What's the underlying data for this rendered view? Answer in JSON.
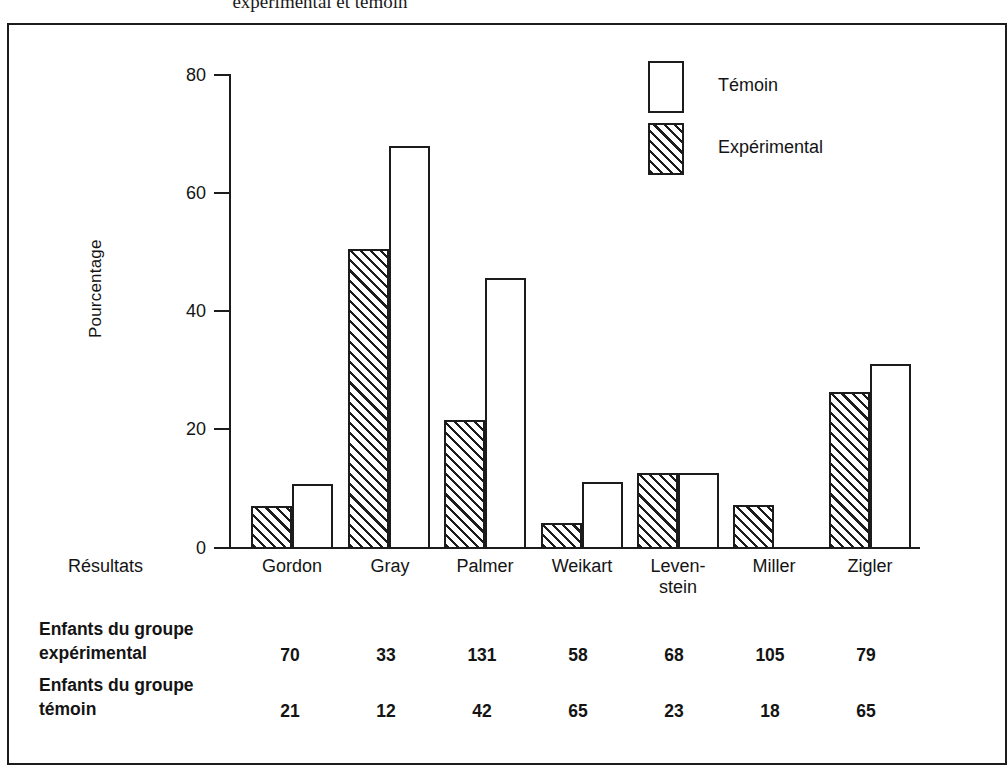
{
  "figure": {
    "title": "expérimental et témoin"
  },
  "chart_data": {
    "type": "bar",
    "title": "expérimental et témoin",
    "xlabel": "Résultats",
    "ylabel": "Pourcentage",
    "ylim": [
      0,
      80
    ],
    "yticks": [
      0,
      20,
      40,
      60,
      80
    ],
    "grid": false,
    "legend_position": "top-right",
    "categories": [
      "Gordon",
      "Gray",
      "Palmer",
      "Weikart",
      "Leven-\nstein",
      "Miller",
      "Zigler"
    ],
    "category_labels": [
      {
        "line1": "Gordon",
        "line2": ""
      },
      {
        "line1": "Gray",
        "line2": ""
      },
      {
        "line1": "Palmer",
        "line2": ""
      },
      {
        "line1": "Weikart",
        "line2": ""
      },
      {
        "line1": "Leven-",
        "line2": "stein"
      },
      {
        "line1": "Miller",
        "line2": ""
      },
      {
        "line1": "Zigler",
        "line2": ""
      }
    ],
    "series": [
      {
        "name": "Expérimental",
        "fill": "hatched",
        "values": [
          7.3,
          50.8,
          21.8,
          4.4,
          12.9,
          7.4,
          26.5
        ]
      },
      {
        "name": "Témoin",
        "fill": "white",
        "values": [
          11.0,
          68.2,
          45.8,
          11.3,
          12.9,
          null,
          31.3
        ]
      }
    ]
  },
  "axis": {
    "y_title": "Pourcentage",
    "y_ticks": [
      "80",
      "60",
      "40",
      "20",
      "0"
    ],
    "x_title": "Résultats"
  },
  "legend": {
    "items": [
      {
        "label": "Témoin",
        "fill": "white"
      },
      {
        "label": "Expérimental",
        "fill": "hatched"
      }
    ]
  },
  "table": {
    "rows": [
      {
        "header_line1": "Enfants du groupe",
        "header_line2": "expérimental",
        "values": [
          "70",
          "33",
          "131",
          "58",
          "68",
          "105",
          "79"
        ]
      },
      {
        "header_line1": "Enfants du groupe",
        "header_line2": "témoin",
        "values": [
          "21",
          "12",
          "42",
          "65",
          "23",
          "18",
          "65"
        ]
      }
    ]
  }
}
